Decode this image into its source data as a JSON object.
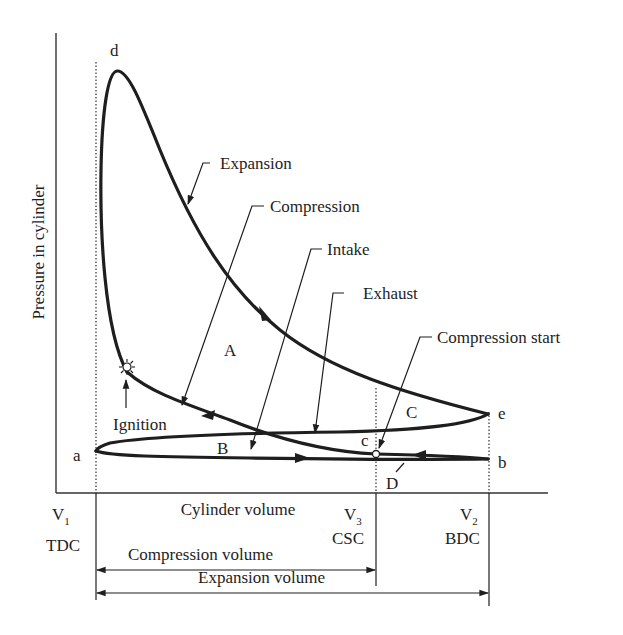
{
  "diagram": {
    "type": "pv-diagram",
    "y_axis_label": "Pressure in cylinder",
    "x_axis_label": "Cylinder volume",
    "points": {
      "a": "a",
      "b": "b",
      "c": "c",
      "d": "d",
      "e": "e"
    },
    "regions": {
      "A": "A",
      "B": "B",
      "C": "C",
      "D": "D"
    },
    "callouts": {
      "expansion": "Expansion",
      "compression": "Compression",
      "intake": "Intake",
      "exhaust": "Exhaust",
      "compression_start": "Compression start",
      "ignition": "Ignition"
    },
    "volume_marks": {
      "v1": {
        "symbol": "V",
        "sub": "1",
        "name": "TDC"
      },
      "v3": {
        "symbol": "V",
        "sub": "3",
        "name": "CSC"
      },
      "v2": {
        "symbol": "V",
        "sub": "2",
        "name": "BDC"
      }
    },
    "dimensions": {
      "compression_volume": "Compression volume",
      "expansion_volume": "Expansion volume"
    },
    "colors": {
      "ink": "#1e1e1e",
      "background": "#ffffff"
    }
  }
}
